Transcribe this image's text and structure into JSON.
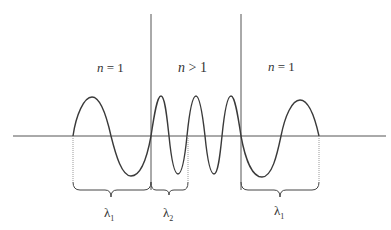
{
  "diagram": {
    "regions": [
      {
        "id": "left",
        "label_var": "n",
        "label_rel": " = 1"
      },
      {
        "id": "middle",
        "label_var": "n",
        "label_rel": " > 1"
      },
      {
        "id": "right",
        "label_var": "n",
        "label_rel": " = 1"
      }
    ],
    "wavelength_labels": [
      {
        "symbol": "λ",
        "subscript": "1"
      },
      {
        "symbol": "λ",
        "subscript": "2"
      },
      {
        "symbol": "λ",
        "subscript": "1"
      }
    ],
    "colors": {
      "line": "#3a3a3a",
      "dotted": "#8a8a8a",
      "text": "#333333"
    }
  }
}
